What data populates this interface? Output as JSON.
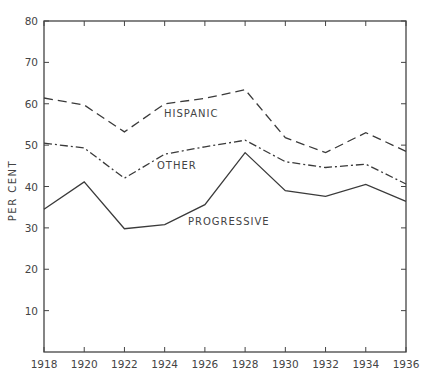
{
  "chart_data": {
    "type": "line",
    "title": "",
    "xlabel": "",
    "ylabel": "PER CENT",
    "ylim": [
      0,
      80
    ],
    "xlim": [
      1918,
      1936
    ],
    "grid": false,
    "legend": "inline labels",
    "x": [
      1918,
      1920,
      1922,
      1924,
      1926,
      1928,
      1930,
      1932,
      1934,
      1936
    ],
    "x_tick_labels": [
      "1918",
      "1920",
      "1922",
      "1924",
      "1926",
      "1928",
      "1930",
      "1932",
      "1934",
      "1936"
    ],
    "y_tick_labels": [
      "10",
      "20",
      "30",
      "40",
      "50",
      "60",
      "70",
      "80"
    ],
    "series": [
      {
        "name": "HISPANIC",
        "style": "dashed",
        "values": [
          61.4,
          59.7,
          53.2,
          60.0,
          61.3,
          63.4,
          51.8,
          48.2,
          53.0,
          48.5
        ]
      },
      {
        "name": "OTHER",
        "style": "dash-dot",
        "values": [
          50.5,
          49.3,
          42.0,
          47.8,
          49.6,
          51.2,
          46.0,
          44.6,
          45.4,
          40.6
        ]
      },
      {
        "name": "PROGRESSIVE",
        "style": "solid",
        "values": [
          34.5,
          41.1,
          29.8,
          30.8,
          35.6,
          48.2,
          39.0,
          37.6,
          40.5,
          36.4
        ]
      }
    ]
  }
}
